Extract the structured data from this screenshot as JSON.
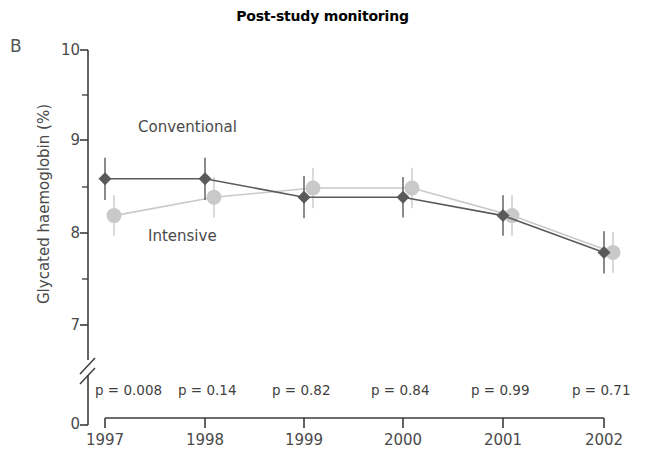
{
  "figure": {
    "panel_label": "B",
    "title": "Post-study monitoring",
    "axis": {
      "ylabel": "Glycated haemoglobin (%)",
      "xlabel": "",
      "y_ticks": [
        "10",
        "9",
        "8",
        "7",
        "0"
      ],
      "x_ticks": [
        "1997",
        "1998",
        "1999",
        "2000",
        "2001",
        "2002"
      ],
      "axis_break": "//"
    },
    "annotations": {
      "conventional_label": "Conventional",
      "intensive_label": "Intensive",
      "p_prefix": "p",
      "p_equals": "="
    },
    "colors": {
      "conventional": "#5a5a5a",
      "intensive": "#c9c9c9",
      "axis": "#3c3c3c",
      "text": "#4a4a4a",
      "title": "#000000"
    }
  },
  "chart_data": {
    "type": "line",
    "title": "Post-study monitoring",
    "xlabel": "",
    "ylabel": "Glycated haemoglobin (%)",
    "categories": [
      "1997",
      "1998",
      "1999",
      "2000",
      "2001",
      "2002"
    ],
    "ylim": [
      7,
      10
    ],
    "yticks": [
      7,
      8,
      9,
      10
    ],
    "y_minor_ticks": [
      7.5,
      8.5,
      9.5
    ],
    "y_axis_break_below": 7,
    "y_axis_origin_label": 0,
    "grid": false,
    "legend": "inline-annotations",
    "series": [
      {
        "name": "Conventional",
        "marker": "diamond",
        "color": "#5a5a5a",
        "values": [
          8.6,
          8.6,
          8.4,
          8.4,
          8.2,
          7.8
        ],
        "errors": [
          0.23,
          0.23,
          0.23,
          0.22,
          0.22,
          0.23
        ]
      },
      {
        "name": "Intensive",
        "marker": "circle",
        "color": "#c9c9c9",
        "values": [
          8.2,
          8.4,
          8.5,
          8.5,
          8.2,
          7.8
        ],
        "errors": [
          0.22,
          0.22,
          0.22,
          0.22,
          0.22,
          0.22
        ]
      }
    ],
    "p_values": [
      "0.008",
      "0.14",
      "0.82",
      "0.84",
      "0.99",
      "0.71"
    ],
    "p_value_labels": [
      "p = 0.008",
      "p = 0.14",
      "p = 0.82",
      "p = 0.84",
      "p = 0.99",
      "p = 0.71"
    ]
  }
}
